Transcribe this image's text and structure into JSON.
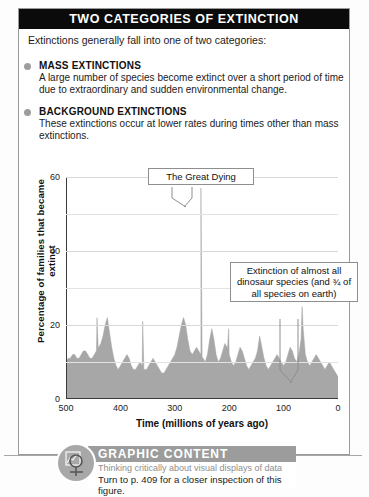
{
  "header": {
    "title": "TWO CATEGORIES OF EXTINCTION"
  },
  "intro": {
    "text": "Extinctions generally fall into one of two categories:"
  },
  "bullets": [
    {
      "icon": "bullet-dot-icon",
      "heading": "MASS EXTINCTIONS",
      "body": "A large number of species become extinct over a short period of time due to extraordinary and sudden environmental change."
    },
    {
      "icon": "bullet-dot-icon",
      "heading": "BACKGROUND EXTINCTIONS",
      "body": "These extinctions occur at lower rates during times other than mass extinctions."
    }
  ],
  "callouts": [
    {
      "text": "The Great Dying"
    },
    {
      "text": "Extinction of almost all dinosaur species (and ¾ of all species on earth)"
    }
  ],
  "footer": {
    "banner_label": "GRAPHIC CONTENT",
    "subtitle": "Thinking critically about visual displays of data",
    "turn_to": "Turn to p. 409 for a closer inspection of this figure.",
    "icon": "magnifier-chart-icon"
  },
  "colors": {
    "header_bar": "#0b0b0b",
    "bullet": "#9d9d9d",
    "area_fill": "#a7a7a7",
    "banner": "#9c9c9c",
    "frame_border": "#9a9a9a",
    "gridline": "#e3e3e3"
  },
  "chart_data": {
    "type": "area",
    "title": "",
    "xlabel": "Time  (millions of years ago)",
    "ylabel": "Percentage of families that became extinct",
    "xlim": [
      500,
      0
    ],
    "ylim": [
      0,
      60
    ],
    "x_ticks": [
      500,
      400,
      300,
      200,
      100,
      0
    ],
    "y_ticks": [
      0,
      20,
      40,
      60
    ],
    "y_minor_gridlines": [
      10,
      30,
      50
    ],
    "x_reversed": true,
    "grid": true,
    "legend": "none",
    "annotations": [
      {
        "label": "The Great Dying",
        "x": 252,
        "y": 57
      },
      {
        "label": "Extinction of almost all dinosaur species (and ¾ of all species on earth)",
        "x": 66,
        "y": 25
      }
    ],
    "x": [
      500,
      496,
      492,
      488,
      484,
      480,
      476,
      472,
      468,
      464,
      460,
      456,
      452,
      448,
      444,
      440,
      436,
      432,
      428,
      424,
      420,
      416,
      412,
      408,
      404,
      400,
      396,
      392,
      388,
      384,
      380,
      376,
      372,
      368,
      364,
      360,
      356,
      352,
      348,
      344,
      340,
      336,
      332,
      328,
      324,
      320,
      316,
      312,
      308,
      304,
      300,
      296,
      292,
      288,
      284,
      280,
      276,
      272,
      268,
      264,
      260,
      256,
      252,
      248,
      244,
      240,
      236,
      232,
      228,
      224,
      220,
      216,
      212,
      208,
      204,
      200,
      196,
      192,
      188,
      184,
      180,
      176,
      172,
      168,
      164,
      160,
      156,
      152,
      148,
      144,
      140,
      136,
      132,
      128,
      124,
      120,
      116,
      112,
      108,
      104,
      100,
      96,
      92,
      88,
      84,
      80,
      76,
      72,
      68,
      66,
      64,
      60,
      56,
      52,
      48,
      44,
      40,
      36,
      32,
      28,
      24,
      20,
      16,
      12,
      8,
      4,
      0
    ],
    "y": [
      10,
      11,
      11,
      12,
      12,
      11,
      11,
      12,
      13,
      13,
      12,
      11,
      11,
      12,
      13,
      14,
      15,
      17,
      20,
      22,
      18,
      14,
      11,
      9,
      8,
      9,
      10,
      11,
      12,
      11,
      9,
      8,
      8,
      9,
      10,
      9,
      8,
      8,
      9,
      10,
      11,
      10,
      9,
      8,
      7,
      7,
      8,
      9,
      10,
      11,
      12,
      14,
      17,
      20,
      22,
      20,
      16,
      13,
      12,
      13,
      14,
      13,
      12,
      11,
      10,
      12,
      16,
      19,
      16,
      12,
      10,
      11,
      13,
      15,
      14,
      12,
      10,
      9,
      10,
      12,
      14,
      13,
      11,
      9,
      8,
      9,
      10,
      11,
      13,
      17,
      14,
      11,
      9,
      8,
      9,
      10,
      11,
      12,
      11,
      10,
      9,
      10,
      12,
      14,
      13,
      11,
      10,
      12,
      16,
      25,
      19,
      12,
      10,
      9,
      10,
      11,
      12,
      11,
      10,
      9,
      8,
      9,
      10,
      9,
      8,
      7,
      6
    ],
    "spikes": [
      {
        "x": 252,
        "y": 57,
        "name": "The Great Dying (Permian-Triassic)"
      },
      {
        "x": 66,
        "y": 25,
        "name": "Cretaceous-Paleogene"
      },
      {
        "x": 443,
        "y": 22,
        "name": "Ordovician-Silurian"
      },
      {
        "x": 359,
        "y": 21,
        "name": "Late Devonian"
      },
      {
        "x": 201,
        "y": 19,
        "name": "Triassic-Jurassic"
      }
    ]
  }
}
